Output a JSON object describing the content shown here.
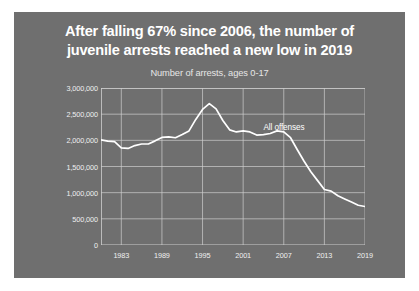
{
  "card": {
    "background_color": "#6f6f6f"
  },
  "title": {
    "line1": "After falling 67% since 2006, the number of",
    "line2": "juvenile arrests reached a new low in 2019",
    "color": "#ffffff"
  },
  "chart_data": {
    "type": "line",
    "title": "After falling 67% since 2006, the number of juvenile arrests reached a new low in 2019",
    "subtitle": "Number of arrests, ages 0-17",
    "xlabel": "",
    "ylabel": "",
    "grid": true,
    "legend_position": "inline-annotation",
    "line_color": "#ffffff",
    "grid_color": "#cfcfcf",
    "xlim": [
      1980,
      2019
    ],
    "ylim": [
      0,
      3000000
    ],
    "ytick_values": [
      0,
      500000,
      1000000,
      1500000,
      2000000,
      2500000,
      3000000
    ],
    "ytick_labels": [
      "0",
      "500,000",
      "1,000,000",
      "1,500,000",
      "2,000,000",
      "2,500,000",
      "3,000,000"
    ],
    "xtick_values": [
      1983,
      1989,
      1995,
      2001,
      2007,
      2013,
      2019
    ],
    "xtick_labels": [
      "1983",
      "1989",
      "1995",
      "2001",
      "2007",
      "2013",
      "2019"
    ],
    "annotations": [
      {
        "text": "All offenses",
        "x": 2004,
        "y": 2330000
      }
    ],
    "series": [
      {
        "name": "All offenses",
        "x": [
          1980,
          1981,
          1982,
          1983,
          1984,
          1985,
          1986,
          1987,
          1988,
          1989,
          1990,
          1991,
          1992,
          1993,
          1994,
          1995,
          1996,
          1997,
          1998,
          1999,
          2000,
          2001,
          2002,
          2003,
          2004,
          2005,
          2006,
          2007,
          2008,
          2009,
          2010,
          2011,
          2012,
          2013,
          2014,
          2015,
          2016,
          2017,
          2018,
          2019
        ],
        "values": [
          2010000,
          1985000,
          1975000,
          1855000,
          1845000,
          1900000,
          1930000,
          1930000,
          1990000,
          2055000,
          2065000,
          2050000,
          2110000,
          2180000,
          2400000,
          2590000,
          2700000,
          2600000,
          2380000,
          2200000,
          2160000,
          2180000,
          2160000,
          2100000,
          2110000,
          2130000,
          2180000,
          2160000,
          2050000,
          1820000,
          1600000,
          1400000,
          1230000,
          1060000,
          1030000,
          940000,
          880000,
          820000,
          760000,
          735000
        ]
      }
    ]
  }
}
